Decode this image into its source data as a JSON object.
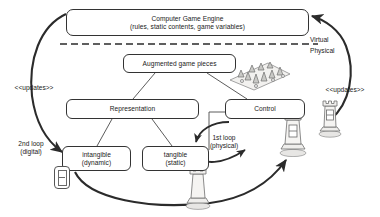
{
  "diagram": {
    "nodes": {
      "engine": {
        "line1": "Computer Game Engine",
        "line2": "(rules, static contents, game variables)"
      },
      "augmented": {
        "line1": "Augmented game pieces",
        "line2": ""
      },
      "representation": {
        "line1": "Representation",
        "line2": ""
      },
      "control": {
        "line1": "Control",
        "line2": ""
      },
      "intangible": {
        "line1": "intangible",
        "line2": "(dynamic)"
      },
      "tangible": {
        "line1": "tangible",
        "line2": "(static)"
      }
    },
    "labels": {
      "updates_left": "<<updates>>",
      "updates_right": "<<updates>>",
      "virtual": "Virtual",
      "physical": "Physical",
      "second_loop": "2nd loop\n(digital)",
      "first_loop": "1st loop\n(physical)"
    },
    "icons": {
      "display_badge": "seven-segment-display-icon",
      "terrain": "augmented-game-board-photo",
      "rook_control": "chess-rook-piece-photo",
      "rook_right": "chess-rook-piece-photo",
      "rook_bottom": "chess-rook-piece-photo"
    },
    "colors": {
      "stroke": "#333333",
      "text": "#1a1a1a",
      "background": "#ffffff",
      "divider": "#333333"
    }
  }
}
